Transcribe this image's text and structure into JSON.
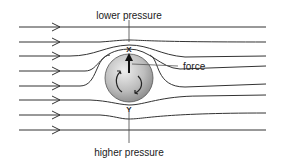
{
  "diagram": {
    "title_top": "lower pressure",
    "title_bottom": "higher pressure",
    "force_label": "force",
    "point_top": "X",
    "point_bottom": "Y",
    "colors": {
      "line": "#333333",
      "ball_light": "#e6e6e6",
      "ball_dark": "#8a8a8a",
      "background": "#ffffff"
    },
    "streamline_count": 8
  }
}
